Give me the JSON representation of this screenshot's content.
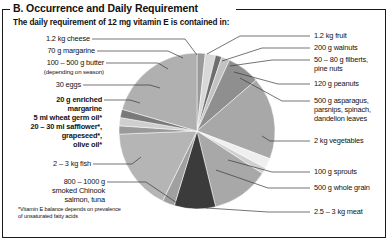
{
  "section": {
    "title": "B. Occurrence and Daily Requirement",
    "subtitle": "The daily requirement of 12 mg vitamin E is contained in:"
  },
  "footnote": {
    "line1": "*Vitamin E balance depends on prevalence",
    "line2": "of unsaturated fatty acids"
  },
  "labels_left": [
    {
      "id": "cheese",
      "text": "1.2 kg cheese",
      "bold": false
    },
    {
      "id": "margarine",
      "text": "70 g margarine",
      "bold": false
    },
    {
      "id": "butter",
      "text": "100 – 500 g butter",
      "bold": false
    },
    {
      "id": "butter-note",
      "text": "(depending on season)",
      "bold": false
    },
    {
      "id": "eggs",
      "text": "30 eggs",
      "bold": false
    },
    {
      "id": "oils-1",
      "text": "20 g enriched",
      "bold": true
    },
    {
      "id": "oils-2",
      "text": "margarine",
      "bold": true
    },
    {
      "id": "oils-3",
      "text": "5 ml wheat germ oil*",
      "bold": true
    },
    {
      "id": "oils-4",
      "text": "20 – 30 ml safflower*,",
      "bold": true
    },
    {
      "id": "oils-5",
      "text": "grapeseed*,",
      "bold": true
    },
    {
      "id": "oils-6",
      "text": "olive oil*",
      "bold": true
    },
    {
      "id": "fish",
      "text": "2 – 3 kg fish",
      "bold": false
    },
    {
      "id": "salmon-1",
      "text": "800 – 1000 g",
      "bold": false
    },
    {
      "id": "salmon-2",
      "text": "smoked Chinook",
      "bold": false
    },
    {
      "id": "salmon-3",
      "text": "salmon, tuna",
      "bold": false
    }
  ],
  "labels_right": [
    {
      "id": "fruit",
      "text": "1.2 kg fruit"
    },
    {
      "id": "walnuts",
      "text": "200 g walnuts"
    },
    {
      "id": "filberts-1",
      "text": "50 – 80 g filberts,"
    },
    {
      "id": "filberts-2",
      "text": "pine nuts"
    },
    {
      "id": "peanuts",
      "text": "120 g peanuts"
    },
    {
      "id": "asparagus-1",
      "text": "500 g asparagus,"
    },
    {
      "id": "asparagus-2",
      "text": "parsnips, spinach,"
    },
    {
      "id": "asparagus-3",
      "text": "dandelion leaves"
    },
    {
      "id": "vegetables",
      "text": "2 kg vegetables"
    },
    {
      "id": "sprouts",
      "text": "100 g sprouts"
    },
    {
      "id": "wholegrain",
      "text": "500 g whole grain"
    },
    {
      "id": "meat",
      "text": "2.5 – 3 kg meat"
    }
  ],
  "chart_data": {
    "type": "pie",
    "title": "The daily requirement of 12 mg vitamin E is contained in:",
    "legend_position": "outside-left-and-right",
    "grid": false,
    "center": [
      197,
      131
    ],
    "radius": 78,
    "start_angle_deg": -90,
    "categories": [
      "1.2 kg fruit",
      "200 g walnuts",
      "50 – 80 g filberts, pine nuts",
      "120 g peanuts",
      "500 g asparagus, parsnips, spinach, dandelion leaves",
      "2 kg vegetables",
      "100 g sprouts",
      "500 g whole grain",
      "2.5 – 3 kg meat",
      "800 – 1000 g smoked Chinook salmon, tuna",
      "2 – 3 kg fish",
      "20 g enriched margarine / 5 ml wheat germ oil* / 20 – 30 ml safflower*, grapeseed*, olive oil*",
      "30 eggs",
      "100 – 500 g butter",
      "70 g margarine",
      "1.2 kg cheese"
    ],
    "values": [
      4,
      5,
      3,
      4,
      16,
      40,
      5,
      3,
      28,
      20,
      6,
      40,
      4,
      4,
      4,
      48
    ],
    "units": "degrees",
    "colors": [
      "#9a9a9a",
      "#d8d8d8",
      "#6e6e6e",
      "#c2c2c2",
      "#8f8f8f",
      "#a8a8a8",
      "#efefef",
      "#d0d0d0",
      "#a8a8a8",
      "#3b3b3b",
      "#a0a0a0",
      "#b5b5b5",
      "#9a9a9a",
      "#cfcfcf",
      "#7a7a7a",
      "#b0b0b0"
    ]
  },
  "colors": {
    "frame": "#1a1a1a",
    "text": "#111111",
    "leader": "#3a3a3a",
    "background": "#ffffff"
  }
}
